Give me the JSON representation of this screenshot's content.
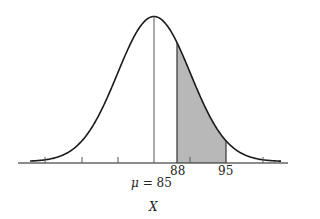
{
  "chart_data": {
    "type": "area",
    "title": "",
    "xlabel": "X",
    "ylabel": "",
    "distribution": "normal",
    "mean": 85,
    "shaded_region": {
      "from": 88,
      "to": 95,
      "color": "#b8b8b8"
    },
    "annotations": [
      {
        "text": "88",
        "x": 88
      },
      {
        "text": "95",
        "x": 95
      },
      {
        "text": "μ = 85",
        "x": 85
      }
    ],
    "grid": false,
    "legend": null
  },
  "labels": {
    "x88": "88",
    "x95": "95",
    "mu_prefix": "μ",
    "mu_eq": " = 85",
    "axis": "X"
  },
  "colors": {
    "curve": "#1a1a1a",
    "shade": "#b8b8b8",
    "axis": "#1a1a1a"
  }
}
